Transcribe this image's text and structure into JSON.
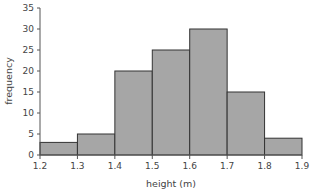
{
  "chart_data": {
    "type": "bar",
    "subtype": "histogram",
    "title": "",
    "xlabel": "height (m)",
    "ylabel": "frequency",
    "bins": [
      {
        "from": 1.2,
        "to": 1.3,
        "value": 3
      },
      {
        "from": 1.3,
        "to": 1.4,
        "value": 5
      },
      {
        "from": 1.4,
        "to": 1.5,
        "value": 20
      },
      {
        "from": 1.5,
        "to": 1.6,
        "value": 25
      },
      {
        "from": 1.6,
        "to": 1.7,
        "value": 30
      },
      {
        "from": 1.7,
        "to": 1.8,
        "value": 15
      },
      {
        "from": 1.8,
        "to": 1.9,
        "value": 4
      }
    ],
    "categories": [
      "1.2-1.3",
      "1.3-1.4",
      "1.4-1.5",
      "1.5-1.6",
      "1.6-1.7",
      "1.7-1.8",
      "1.8-1.9"
    ],
    "values": [
      3,
      5,
      20,
      25,
      30,
      15,
      4
    ],
    "xticks": [
      "1.2",
      "1.3",
      "1.4",
      "1.5",
      "1.6",
      "1.7",
      "1.8",
      "1.9"
    ],
    "yticks": [
      "0",
      "5",
      "10",
      "15",
      "20",
      "25",
      "30",
      "35"
    ],
    "xlim": [
      1.2,
      1.9
    ],
    "ylim": [
      0,
      35
    ],
    "grid": false,
    "legend": null,
    "colors": {
      "bar_fill": "#a6a6a6",
      "bar_stroke": "#333333",
      "axis": "#555555"
    }
  }
}
